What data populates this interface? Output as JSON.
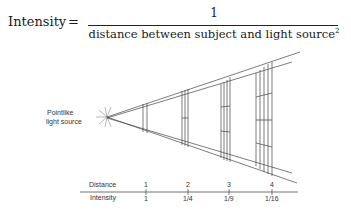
{
  "formula": {
    "lhs": "Intensity",
    "equals": "=",
    "numerator": "1",
    "denominator": "distance between subject and light source",
    "exponent": "2"
  },
  "source_label": {
    "line1": "Pointlike",
    "line2": "light source"
  },
  "axis": {
    "distance_label": "Distance",
    "intensity_label": "Intensity",
    "distances": [
      "1",
      "2",
      "3",
      "4"
    ],
    "intensities": [
      "1",
      "1/4",
      "1/9",
      "1/16"
    ]
  }
}
